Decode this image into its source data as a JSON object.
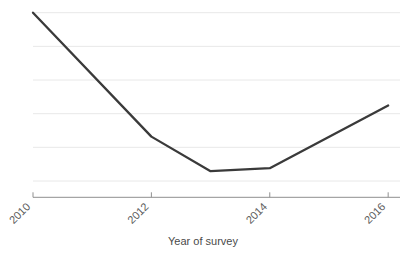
{
  "chart_data": {
    "type": "line",
    "title": "",
    "xlabel": "Year of survey",
    "ylabel": "",
    "x": [
      2010,
      2012,
      2013,
      2014,
      2016
    ],
    "values": [
      5.5,
      1.45,
      0.32,
      0.42,
      2.47
    ],
    "series": [
      {
        "name": "",
        "x": [
          2010,
          2012,
          2013,
          2014,
          2016
        ],
        "values": [
          5.5,
          1.45,
          0.32,
          0.42,
          2.47
        ]
      }
    ],
    "xticks": [
      "2010",
      "2012",
      "2014",
      "2016"
    ],
    "xtick_values": [
      2010,
      2012,
      2014,
      2016
    ],
    "yticks": [],
    "xlim": [
      2010,
      2016.2
    ],
    "ylim": [
      0,
      5.5
    ],
    "grid": "horizontal",
    "gridline_count": 6,
    "legend": "none",
    "line_color": "#3a3a3a",
    "gridline_color": "#e8e8e8",
    "axis_color": "#909090",
    "background_color": "#ffffff",
    "xtick_label_rotation": -45
  },
  "axis": {
    "x_title": "Year of survey",
    "tick_labels": [
      {
        "text": "2010",
        "x": 2010
      },
      {
        "text": "2012",
        "x": 2012
      },
      {
        "text": "2014",
        "x": 2014
      },
      {
        "text": "2016",
        "x": 2016
      }
    ]
  }
}
